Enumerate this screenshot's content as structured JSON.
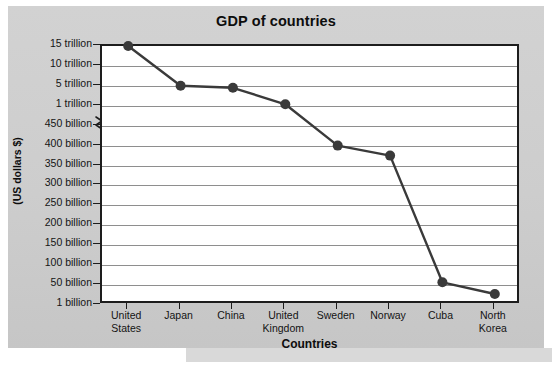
{
  "chart_data": {
    "type": "line",
    "title": "GDP of countries",
    "xlabel": "Countries",
    "ylabel": "(US dollars $)",
    "grid": true,
    "legend": null,
    "categories": [
      "United States",
      "Japan",
      "China",
      "United Kingdom",
      "Sweden",
      "Norway",
      "Cuba",
      "North Korea"
    ],
    "category_lines": [
      [
        "United",
        "States"
      ],
      [
        "Japan"
      ],
      [
        "China"
      ],
      [
        "United",
        "Kingdom"
      ],
      [
        "Sweden"
      ],
      [
        "Norway"
      ],
      [
        "Cuba"
      ],
      [
        "North",
        "Korea"
      ]
    ],
    "values": [
      15000,
      5000,
      4600,
      1300,
      400,
      375,
      57,
      28
    ],
    "value_units": "billion US dollars",
    "value_labels": [
      "15 trillion",
      "5 trillion",
      "4.6 trillion",
      "1.3 trillion",
      "400 billion",
      "375 billion",
      "57 billion",
      "28 billion"
    ],
    "ytick_labels": [
      "15 trillion",
      "10 trillion",
      "5 trillion",
      "1 trillion",
      "450 billion",
      "400 billion",
      "350 billion",
      "300 billion",
      "250 billion",
      "200 billion",
      "150 billion",
      "100 billion",
      "50 billion",
      "1 billion"
    ],
    "yaxis_broken": true,
    "yaxis_break_between": [
      "1 trillion",
      "450 billion"
    ],
    "series_color": "#3a3a3a",
    "marker_color": "#3a3a3a",
    "gridline_color": "#8e8e8e",
    "plot_bg": "#ffffff",
    "card_bg": "#cdcdcd"
  },
  "icons": {
    "axis_break": "axis-break-zigzag"
  }
}
